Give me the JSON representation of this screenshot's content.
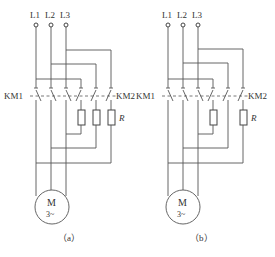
{
  "diagrams": [
    {
      "id": "a",
      "caption": "（a）",
      "lines": [
        "L1",
        "L2",
        "L3"
      ],
      "contactor_left_label": "KM1",
      "contactor_right_label": "KM2",
      "resistor_label": "R",
      "resistor_count": 3,
      "motor_label": "M",
      "motor_sub_label": "3~"
    },
    {
      "id": "b",
      "caption": "（b）",
      "lines": [
        "L1",
        "L2",
        "L3"
      ],
      "contactor_left_label": "KM1",
      "contactor_right_label": "KM2",
      "resistor_label": "R",
      "resistor_count": 2,
      "motor_label": "M",
      "motor_sub_label": "3~"
    }
  ]
}
